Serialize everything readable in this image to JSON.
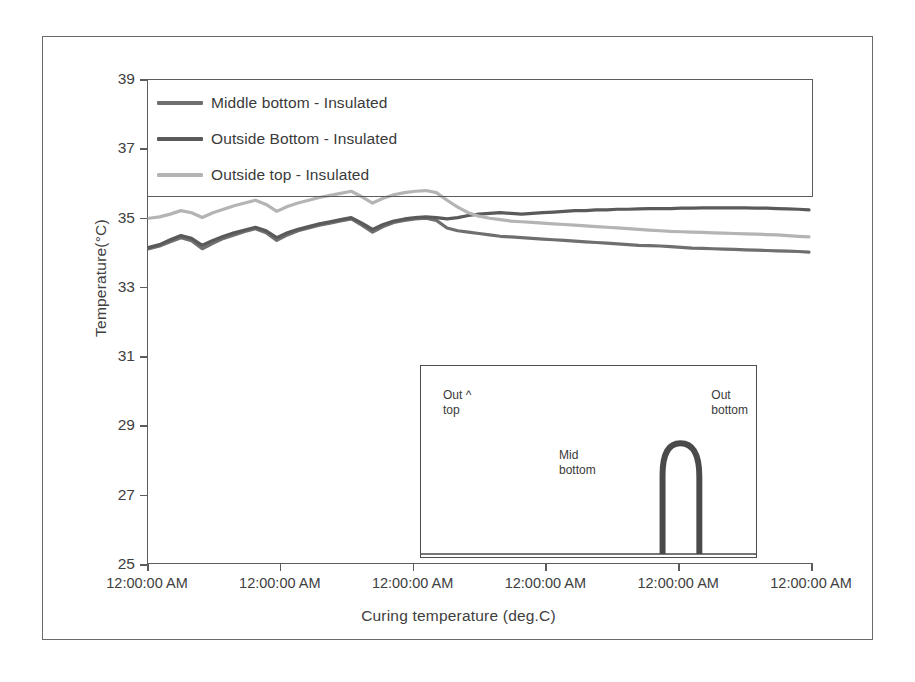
{
  "chart_data": {
    "type": "line",
    "title": "",
    "xlabel": "Curing temperature  (deg.C)",
    "ylabel": "Temperature(°C)",
    "ylim": [
      25,
      39
    ],
    "yticks": [
      25,
      27,
      29,
      31,
      33,
      35,
      37,
      39
    ],
    "ytick_labels": [
      "25",
      "27",
      "29",
      "31",
      "33",
      "35",
      "37",
      "39"
    ],
    "xticks": [
      0,
      1,
      2,
      3,
      4,
      5
    ],
    "xtick_labels": [
      "12:00:00 AM",
      "12:00:00 AM",
      "12:00:00 AM",
      "12:00:00 AM",
      "12:00:00 AM",
      "12:00:00 AM"
    ],
    "grid": false,
    "legend_position": "top-left",
    "colors": {
      "middle_bottom": "#6f6f6f",
      "outside_bottom": "#5a5a5a",
      "outside_top": "#b4b4b4"
    },
    "series": [
      {
        "name": "Middle bottom - Insulated",
        "color": "#6f6f6f",
        "values": [
          34.1,
          34.18,
          34.3,
          34.42,
          34.33,
          34.1,
          34.26,
          34.4,
          34.5,
          34.6,
          34.68,
          34.56,
          34.34,
          34.5,
          34.62,
          34.7,
          34.78,
          34.84,
          34.9,
          34.96,
          34.78,
          34.58,
          34.74,
          34.86,
          34.92,
          34.96,
          34.98,
          34.92,
          34.7,
          34.62,
          34.58,
          34.54,
          34.5,
          34.46,
          34.44,
          34.42,
          34.4,
          34.38,
          34.36,
          34.34,
          34.32,
          34.3,
          34.28,
          34.26,
          34.24,
          34.22,
          34.2,
          34.19,
          34.18,
          34.16,
          34.14,
          34.12,
          34.11,
          34.1,
          34.09,
          34.08,
          34.07,
          34.06,
          34.05,
          34.04,
          34.03,
          34.02,
          34.0
        ]
      },
      {
        "name": "Outside Bottom - Insulated",
        "color": "#5a5a5a",
        "values": [
          34.14,
          34.22,
          34.36,
          34.48,
          34.4,
          34.2,
          34.34,
          34.46,
          34.56,
          34.64,
          34.72,
          34.62,
          34.42,
          34.56,
          34.66,
          34.74,
          34.82,
          34.88,
          34.94,
          35.0,
          34.84,
          34.66,
          34.8,
          34.9,
          34.96,
          35.0,
          35.02,
          35.0,
          34.96,
          35.0,
          35.06,
          35.1,
          35.12,
          35.14,
          35.12,
          35.1,
          35.12,
          35.14,
          35.16,
          35.18,
          35.2,
          35.2,
          35.22,
          35.22,
          35.24,
          35.24,
          35.25,
          35.26,
          35.26,
          35.26,
          35.27,
          35.27,
          35.28,
          35.28,
          35.28,
          35.28,
          35.28,
          35.27,
          35.27,
          35.26,
          35.25,
          35.24,
          35.22
        ]
      },
      {
        "name": "Outside top - Insulated",
        "color": "#b4b4b4",
        "values": [
          34.98,
          35.02,
          35.1,
          35.2,
          35.14,
          35.0,
          35.14,
          35.24,
          35.34,
          35.42,
          35.5,
          35.38,
          35.18,
          35.32,
          35.42,
          35.5,
          35.58,
          35.64,
          35.7,
          35.76,
          35.6,
          35.42,
          35.56,
          35.66,
          35.72,
          35.76,
          35.78,
          35.72,
          35.5,
          35.3,
          35.14,
          35.04,
          34.98,
          34.94,
          34.9,
          34.88,
          34.86,
          34.84,
          34.82,
          34.8,
          34.78,
          34.76,
          34.74,
          34.72,
          34.7,
          34.68,
          34.66,
          34.64,
          34.62,
          34.6,
          34.59,
          34.58,
          34.57,
          34.56,
          34.55,
          34.54,
          34.53,
          34.52,
          34.51,
          34.5,
          34.48,
          34.46,
          34.44
        ]
      }
    ]
  },
  "legend": {
    "items": [
      {
        "label": "Middle bottom - Insulated",
        "color": "#6f6f6f"
      },
      {
        "label": "Outside Bottom - Insulated",
        "color": "#5a5a5a"
      },
      {
        "label": "Outside top - Insulated",
        "color": "#b4b4b4"
      }
    ]
  },
  "inset": {
    "labels": [
      {
        "text": "Out ^\ntop"
      },
      {
        "text": "Out\nbottom"
      },
      {
        "text": "Mid\nbottom"
      }
    ],
    "arch_color": "#4a4a4a"
  }
}
